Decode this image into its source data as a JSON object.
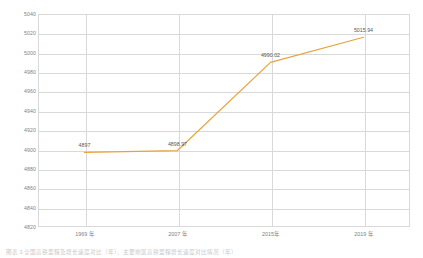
{
  "chart_data": {
    "type": "line",
    "title": "",
    "subtitle": "",
    "xlabel": "",
    "ylabel": "",
    "categories": [
      "1969 年",
      "2007 年",
      "2015年",
      "2019 年"
    ],
    "values": [
      4897,
      4898.97,
      4990.02,
      5015.94
    ],
    "point_labels": [
      "4897",
      "4898.97",
      "4990.02",
      "5015.94"
    ],
    "series": [
      {
        "name": "",
        "values": [
          4897,
          4898.97,
          4990.02,
          5015.94
        ],
        "color": "#e8a33d"
      }
    ],
    "ylim": [
      4820,
      5040
    ],
    "ytick_step": 20,
    "ytick_labels": [
      "5040",
      "5020",
      "5000",
      "4980",
      "4960",
      "4940",
      "4920",
      "4900",
      "4880",
      "4860",
      "4840",
      "4820"
    ],
    "ytick_values": [
      5040,
      5020,
      5000,
      4980,
      4960,
      4940,
      4920,
      4900,
      4880,
      4860,
      4840,
      4820
    ],
    "grid": {
      "horizontal": true,
      "vertical": true,
      "color": "#d9d9d9"
    },
    "legend": {
      "visible": false,
      "position": "none"
    },
    "plot_background": "#ffffff",
    "line_color": "#e8a33d",
    "line_width": 1.2,
    "markers": false
  },
  "caption": {
    "text": "图表 3    全国高铁里程及增长速度对比（年）、主要地区高铁里程增长速度对比情况（年）"
  }
}
